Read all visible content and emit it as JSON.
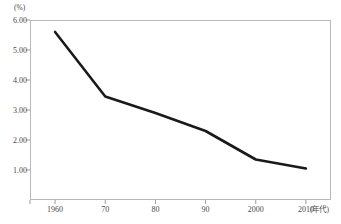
{
  "chart_data": {
    "type": "line",
    "title": "",
    "subtitle": "",
    "xlabel": "(年代)",
    "ylabel": "(%)",
    "x": [
      1960,
      1970,
      1980,
      1990,
      2000,
      2010
    ],
    "x_tick_labels": [
      "1960",
      "70",
      "80",
      "90",
      "2000",
      "2010"
    ],
    "y_tick_labels": [
      "6.00",
      "5.00",
      "4.00",
      "3.00",
      "2.00",
      "1.00"
    ],
    "y_tick_values": [
      6.0,
      5.0,
      4.0,
      3.0,
      2.0,
      1.0
    ],
    "xlim": [
      1955,
      2015
    ],
    "ylim": [
      0.0,
      6.0
    ],
    "grid": false,
    "legend": null,
    "series": [
      {
        "name": "",
        "color": "#1a1a1a",
        "line_width": 2.6,
        "values": [
          5.6,
          3.45,
          2.9,
          2.3,
          1.35,
          1.05
        ]
      }
    ],
    "axis_color": "#b8b8b8",
    "tick_color": "#9a9a9a",
    "text_color": "#4a4a4a",
    "background": "#ffffff"
  }
}
